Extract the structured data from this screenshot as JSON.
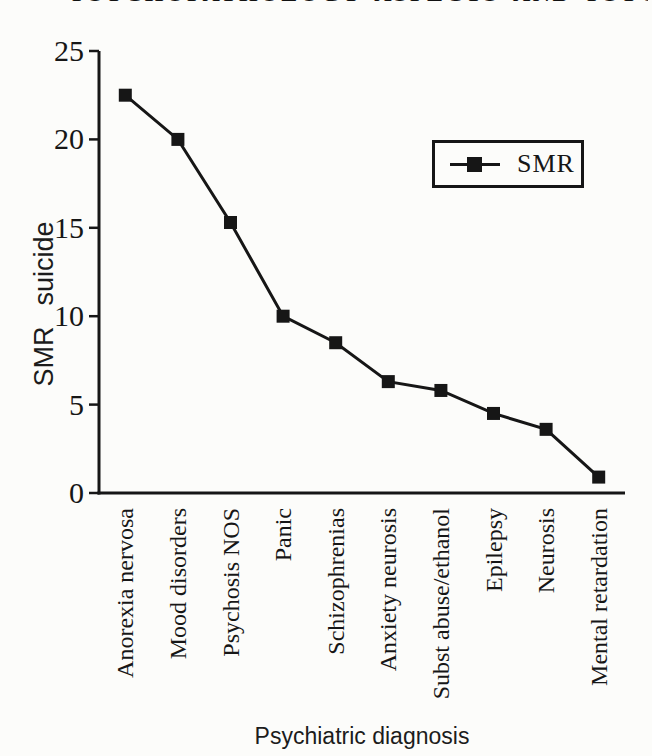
{
  "page": {
    "background": "#fcfcfa",
    "ink_color": "#161616",
    "cropped_running_head": {
      "approx_text": "PSYCHOPATHOLOGY ASPECTS AND PSYCHIATRY"
    }
  },
  "chart_data": {
    "type": "line",
    "title": "",
    "xlabel": "Psychiatric diagnosis",
    "ylabel": "SMR suicide",
    "categories": [
      "Anorexia nervosa",
      "Mood disorders",
      "Psychosis NOS",
      "Panic",
      "Schizophrenias",
      "Anxiety neurosis",
      "Subst abuse/ethanol",
      "Epilepsy",
      "Neurosis",
      "Mental retardation"
    ],
    "series": [
      {
        "name": "SMR",
        "marker": "filled-square",
        "values": [
          22.5,
          20,
          15.3,
          10,
          8.5,
          6.3,
          5.8,
          4.5,
          3.6,
          0.9
        ]
      }
    ],
    "ylim": [
      0,
      25
    ],
    "yticks": [
      0,
      5,
      10,
      15,
      20,
      25
    ],
    "grid": false,
    "legend_position": "upper-right",
    "line_color": "#161616"
  }
}
